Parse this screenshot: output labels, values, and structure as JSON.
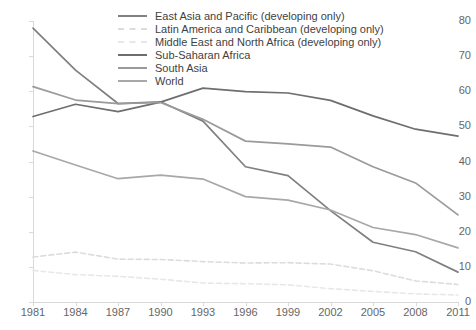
{
  "chart_data": {
    "type": "line",
    "title": "",
    "subtitle": "",
    "xlabel": "",
    "ylabel": "",
    "x": [
      1981,
      1984,
      1987,
      1990,
      1993,
      1996,
      1999,
      2002,
      2005,
      2008,
      2011
    ],
    "xtick_labels": [
      "1981",
      "1984",
      "1987",
      "1990",
      "1993",
      "1996",
      "1999",
      "2002",
      "2005",
      "2008",
      "2011"
    ],
    "ytick_labels": [
      "0",
      "10",
      "20",
      "30",
      "40",
      "50",
      "60",
      "70",
      "80"
    ],
    "ylim": [
      0,
      80
    ],
    "ytick_step": 10,
    "grid": false,
    "legend_position": "top-center",
    "series": [
      {
        "name": "East Asia and Pacific (developing only)",
        "style": "solid",
        "color": "#808080",
        "values": [
          78.0,
          66.0,
          56.5,
          57.0,
          51.5,
          38.5,
          36.0,
          26.0,
          17.0,
          14.3,
          8.5
        ]
      },
      {
        "name": "Latin America and Caribbean (developing only)",
        "style": "dashed",
        "color": "#dcdcdc",
        "values": [
          12.8,
          14.2,
          12.2,
          12.1,
          11.5,
          11.1,
          11.2,
          10.8,
          8.9,
          6.0,
          5.0
        ]
      },
      {
        "name": "Middle East and North Africa (developing only)",
        "style": "dashed",
        "color": "#e8e8e8",
        "values": [
          9.0,
          7.8,
          7.3,
          6.5,
          5.4,
          5.2,
          4.9,
          3.8,
          3.0,
          2.3,
          2.0
        ]
      },
      {
        "name": "Sub-Saharan Africa",
        "style": "solid",
        "color": "#6e6e6e",
        "values": [
          52.8,
          56.3,
          54.2,
          56.9,
          60.9,
          59.9,
          59.5,
          57.4,
          53.0,
          49.2,
          47.2
        ]
      },
      {
        "name": "South Asia",
        "style": "solid",
        "color": "#9a9a9a",
        "values": [
          61.3,
          57.5,
          56.5,
          56.8,
          52.0,
          45.8,
          45.0,
          44.1,
          38.5,
          33.9,
          24.8
        ]
      },
      {
        "name": "World",
        "style": "solid",
        "color": "#a8a8a8",
        "values": [
          43.0,
          39.0,
          35.1,
          36.1,
          35.0,
          30.0,
          29.0,
          26.2,
          21.2,
          19.2,
          15.4
        ]
      }
    ]
  }
}
